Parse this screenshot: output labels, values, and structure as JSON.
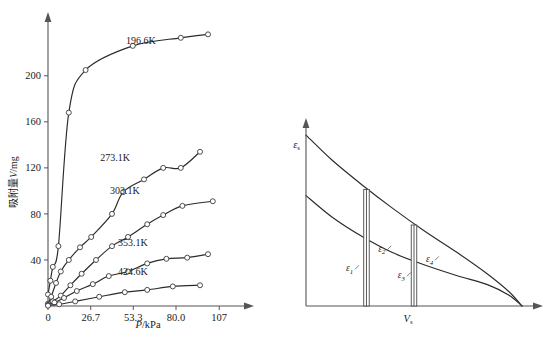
{
  "figure": {
    "background_color": "#ffffff",
    "ink_color": "#2b2b2b",
    "axis_color": "#555555"
  },
  "chart_data": [
    {
      "id": "adsorption-isotherms",
      "type": "scatter",
      "title": "",
      "xlabel": "P/kPa",
      "ylabel": "吸附量V/mg",
      "xlabel_italic_part": "P",
      "ylabel_italic_part": "V",
      "xlim": [
        0,
        120
      ],
      "ylim": [
        0,
        245
      ],
      "grid": false,
      "legend_position": "inline-curve-labels",
      "xticks": [
        0,
        26.7,
        53.3,
        80.0,
        107
      ],
      "xticklabels": [
        "0",
        "26.7",
        "53.3",
        "80.0",
        "107"
      ],
      "yticks": [
        40,
        80,
        120,
        160,
        200
      ],
      "yticklabels": [
        "40",
        "80",
        "120",
        "160",
        "200"
      ],
      "series": [
        {
          "name": "196.6K",
          "label": "196.6K",
          "label_x": 58,
          "label_y": 228,
          "x": [
            0.0,
            1.5,
            3.0,
            6.5,
            13.0,
            23.5,
            53.0,
            83.0,
            100.0
          ],
          "y": [
            10,
            22,
            34,
            52,
            168,
            205,
            226,
            233,
            236
          ]
        },
        {
          "name": "273.1K",
          "label": "273.1K",
          "label_x": 42,
          "label_y": 126,
          "x": [
            0.0,
            2.0,
            5.0,
            8.0,
            13.0,
            20.0,
            27.0,
            40.0,
            47.0,
            60.0,
            72.0,
            83.0,
            95.0
          ],
          "y": [
            2,
            8,
            20,
            30,
            40,
            51,
            60,
            80,
            99,
            110,
            120,
            120,
            134
          ]
        },
        {
          "name": "303.1K",
          "label": "303.1K",
          "label_x": 48,
          "label_y": 97,
          "x": [
            0.0,
            3.0,
            8.0,
            14.0,
            21.0,
            30.0,
            40.0,
            50.0,
            62.0,
            72.0,
            84.0,
            103.0
          ],
          "y": [
            1,
            4,
            9,
            18,
            28,
            40,
            52,
            60,
            71,
            79,
            87,
            91
          ]
        },
        {
          "name": "353.1K",
          "label": "353.1K",
          "label_x": 53,
          "label_y": 52,
          "x": [
            0.0,
            4.0,
            10.0,
            18.0,
            28.0,
            38.0,
            50.0,
            62.0,
            74.0,
            87.0,
            100.0
          ],
          "y": [
            0.5,
            3,
            7,
            13,
            19,
            26,
            30,
            37,
            41,
            42,
            45
          ]
        },
        {
          "name": "424.6K",
          "label": "424.6K",
          "label_x": 53,
          "label_y": 27,
          "x": [
            0.0,
            7.0,
            17.0,
            32.0,
            48.0,
            62.0,
            78.0,
            95.0
          ],
          "y": [
            0.3,
            1.5,
            4,
            8,
            12,
            14,
            17,
            18
          ]
        }
      ]
    },
    {
      "id": "characteristic-curves",
      "type": "line",
      "title": "",
      "xlabel": "V_s",
      "xlabel_base": "V",
      "xlabel_sub": "s",
      "ylabel": "ε_s",
      "ylabel_base": "ε",
      "ylabel_sub": "s",
      "grid": false,
      "xlim": [
        0,
        1
      ],
      "ylim": [
        0,
        1
      ],
      "curves": [
        {
          "name": "upper-characteristic-curve",
          "points_norm": [
            [
              0.0,
              0.96
            ],
            [
              0.12,
              0.82
            ],
            [
              0.26,
              0.68
            ],
            [
              0.4,
              0.55
            ],
            [
              0.55,
              0.42
            ],
            [
              0.7,
              0.3
            ],
            [
              0.84,
              0.18
            ],
            [
              0.94,
              0.08
            ],
            [
              1.0,
              0.0
            ]
          ]
        },
        {
          "name": "lower-characteristic-curve",
          "points_norm": [
            [
              0.0,
              0.62
            ],
            [
              0.12,
              0.5
            ],
            [
              0.26,
              0.39
            ],
            [
              0.4,
              0.3
            ],
            [
              0.55,
              0.23
            ],
            [
              0.7,
              0.17
            ],
            [
              0.84,
              0.12
            ],
            [
              0.94,
              0.06
            ],
            [
              1.0,
              0.0
            ]
          ]
        }
      ],
      "bars": [
        {
          "name": "bar-left",
          "x_norm": 0.28,
          "top_norm": 0.655,
          "bottom_norm": 0.0
        },
        {
          "name": "bar-right",
          "x_norm": 0.5,
          "top_norm": 0.455,
          "bottom_norm": 0.0
        }
      ],
      "annotations": [
        {
          "name": "epsilon-1",
          "base": "ε",
          "sub": "1",
          "x_norm": 0.185,
          "y_norm": 0.195
        },
        {
          "name": "epsilon-2",
          "base": "ε",
          "sub": "2",
          "x_norm": 0.335,
          "y_norm": 0.305
        },
        {
          "name": "epsilon-3",
          "base": "ε",
          "sub": "3",
          "x_norm": 0.425,
          "y_norm": 0.155
        },
        {
          "name": "epsilon-4",
          "base": "ε",
          "sub": "4",
          "x_norm": 0.555,
          "y_norm": 0.245
        }
      ]
    }
  ]
}
